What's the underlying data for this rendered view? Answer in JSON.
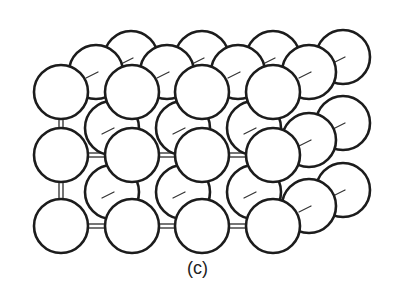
{
  "figure": {
    "caption": "(c)",
    "colors": {
      "background": "#ffffff",
      "sphere_fill": "#ffffff",
      "outline": "#1c1c1c"
    },
    "radius": 27,
    "layers": [
      {
        "name": "back",
        "spheres": [
          {
            "x": 131,
            "y": 58
          },
          {
            "x": 202,
            "y": 58
          },
          {
            "x": 273,
            "y": 58
          },
          {
            "x": 343,
            "y": 57
          },
          {
            "x": 343,
            "y": 123
          },
          {
            "x": 343,
            "y": 190
          }
        ]
      },
      {
        "name": "middle",
        "spheres": [
          {
            "x": 96,
            "y": 72
          },
          {
            "x": 167,
            "y": 72
          },
          {
            "x": 238,
            "y": 72
          },
          {
            "x": 309,
            "y": 72
          },
          {
            "x": 112,
            "y": 128
          },
          {
            "x": 183,
            "y": 128
          },
          {
            "x": 254,
            "y": 128
          },
          {
            "x": 309,
            "y": 140
          },
          {
            "x": 112,
            "y": 192
          },
          {
            "x": 183,
            "y": 192
          },
          {
            "x": 254,
            "y": 192
          },
          {
            "x": 309,
            "y": 206
          }
        ]
      },
      {
        "name": "front",
        "spheres": [
          {
            "x": 61,
            "y": 92
          },
          {
            "x": 132,
            "y": 92
          },
          {
            "x": 202,
            "y": 92
          },
          {
            "x": 273,
            "y": 92
          },
          {
            "x": 61,
            "y": 155
          },
          {
            "x": 132,
            "y": 155
          },
          {
            "x": 202,
            "y": 155
          },
          {
            "x": 273,
            "y": 155
          },
          {
            "x": 61,
            "y": 226
          },
          {
            "x": 132,
            "y": 226
          },
          {
            "x": 202,
            "y": 226
          },
          {
            "x": 273,
            "y": 226
          }
        ]
      }
    ]
  }
}
